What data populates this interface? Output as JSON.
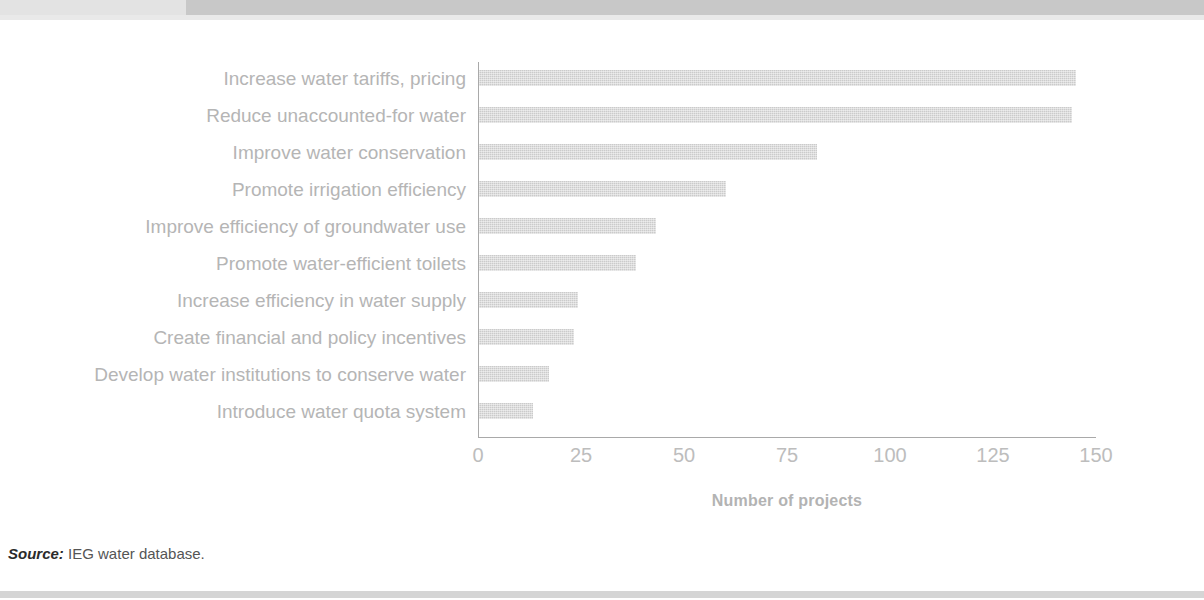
{
  "figure": {
    "source_label": "Source:",
    "source_text": "IEG water database."
  },
  "chart_data": {
    "type": "bar",
    "orientation": "horizontal",
    "title": "",
    "xlabel": "Number of projects",
    "ylabel": "",
    "xlim": [
      0,
      150
    ],
    "xticks": [
      0,
      25,
      50,
      75,
      100,
      125,
      150
    ],
    "xtick_labels": [
      "0",
      "25",
      "50",
      "75",
      "100",
      "125",
      "150"
    ],
    "grid": false,
    "legend": null,
    "bar_color": "#cbcbcb",
    "axis_color": "#a9a9a9",
    "label_color": "#b5b5b5",
    "categories": [
      "Increase water tariffs, pricing",
      "Reduce unaccounted-for water",
      "Improve water conservation",
      "Promote irrigation efficiency",
      "Improve efficiency of groundwater use",
      "Promote water-efficient toilets",
      "Increase efficiency in water supply",
      "Create financial and policy incentives",
      "Develop water institutions to conserve water",
      "Introduce water quota system"
    ],
    "values": [
      145,
      144,
      82,
      60,
      43,
      38,
      24,
      23,
      17,
      13
    ]
  }
}
